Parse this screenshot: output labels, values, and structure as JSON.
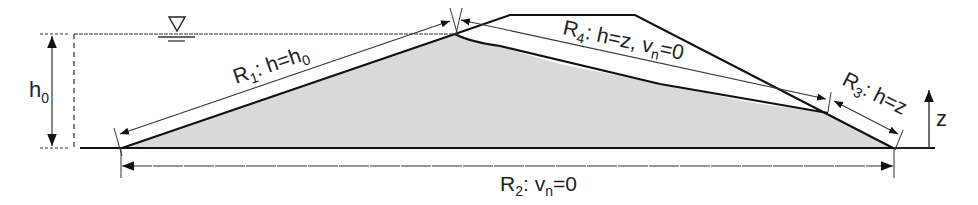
{
  "diagram": {
    "colors": {
      "fill": "#d9d9d9",
      "line": "#111111",
      "thin": "#333333"
    },
    "labels": {
      "h0": "h",
      "h0_sub": "0",
      "z_axis": "z",
      "r1": {
        "name": "R",
        "sub": "1",
        "text": ": h=h",
        "text_sub": "0"
      },
      "r2": {
        "name": "R",
        "sub": "2",
        "text": ": v",
        "text_sub": "n",
        "tail": "=0"
      },
      "r3": {
        "name": "R",
        "sub": "3",
        "text": ": h=z"
      },
      "r4": {
        "name": "R",
        "sub": "4",
        "text": ": h=z, v",
        "text_sub": "n",
        "tail": "=0"
      }
    },
    "symbols": {
      "water_level": "water-level-triangle"
    }
  }
}
